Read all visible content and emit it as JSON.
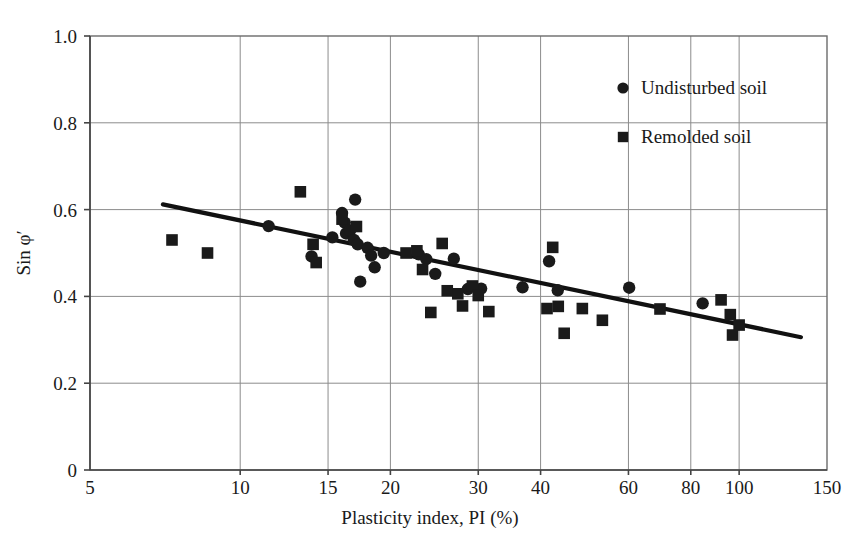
{
  "chart_data": {
    "type": "scatter",
    "title": "",
    "xlabel": "Plasticity index, PI (%)",
    "ylabel": "Sin φ′",
    "xscale": "log",
    "yscale": "linear",
    "xlim": [
      5,
      150
    ],
    "ylim": [
      0,
      1.0
    ],
    "grid": true,
    "xticks": [
      5,
      10,
      15,
      20,
      30,
      40,
      60,
      80,
      100,
      150
    ],
    "xtick_labels": [
      "5",
      "10",
      "15",
      "20",
      "30",
      "40",
      "60",
      "80",
      "100",
      "150"
    ],
    "yticks": [
      0,
      0.2,
      0.4,
      0.6,
      0.8,
      1.0
    ],
    "ytick_labels": [
      "0",
      "0.2",
      "0.4",
      "0.6",
      "0.8",
      "1.0"
    ],
    "legend_position": "top-right",
    "series": [
      {
        "name": "Undisturbed soil",
        "marker": "circle",
        "color": "#1a1a1a",
        "points": [
          [
            11.4,
            0.562
          ],
          [
            13.9,
            0.492
          ],
          [
            15.3,
            0.536
          ],
          [
            16.0,
            0.592
          ],
          [
            16.2,
            0.57
          ],
          [
            16.3,
            0.545
          ],
          [
            16.6,
            0.552
          ],
          [
            16.9,
            0.53
          ],
          [
            17.0,
            0.623
          ],
          [
            17.2,
            0.52
          ],
          [
            17.4,
            0.434
          ],
          [
            18.0,
            0.512
          ],
          [
            18.3,
            0.494
          ],
          [
            18.6,
            0.467
          ],
          [
            19.4,
            0.5
          ],
          [
            22.8,
            0.497
          ],
          [
            23.6,
            0.486
          ],
          [
            24.6,
            0.452
          ],
          [
            26.8,
            0.487
          ],
          [
            28.6,
            0.417
          ],
          [
            30.4,
            0.418
          ],
          [
            36.8,
            0.421
          ],
          [
            41.6,
            0.481
          ],
          [
            43.3,
            0.414
          ],
          [
            60.2,
            0.42
          ],
          [
            84.5,
            0.384
          ]
        ]
      },
      {
        "name": "Remolded soil",
        "marker": "square",
        "color": "#1a1a1a",
        "points": [
          [
            7.3,
            0.53
          ],
          [
            8.6,
            0.5
          ],
          [
            13.2,
            0.641
          ],
          [
            14.0,
            0.52
          ],
          [
            14.2,
            0.478
          ],
          [
            16.0,
            0.578
          ],
          [
            17.1,
            0.561
          ],
          [
            21.5,
            0.5
          ],
          [
            22.6,
            0.505
          ],
          [
            23.2,
            0.462
          ],
          [
            24.1,
            0.363
          ],
          [
            25.4,
            0.522
          ],
          [
            26.0,
            0.413
          ],
          [
            27.3,
            0.406
          ],
          [
            27.9,
            0.378
          ],
          [
            29.2,
            0.424
          ],
          [
            30.0,
            0.402
          ],
          [
            31.5,
            0.365
          ],
          [
            41.2,
            0.372
          ],
          [
            42.3,
            0.513
          ],
          [
            43.4,
            0.377
          ],
          [
            44.6,
            0.315
          ],
          [
            48.5,
            0.372
          ],
          [
            53.2,
            0.345
          ],
          [
            69.4,
            0.371
          ],
          [
            92.0,
            0.392
          ],
          [
            96.0,
            0.358
          ],
          [
            97.0,
            0.311
          ],
          [
            100.0,
            0.334
          ]
        ]
      }
    ],
    "trend_line": {
      "name": "best-fit-trend",
      "points": [
        [
          7.0,
          0.612
        ],
        [
          133.0,
          0.306
        ]
      ]
    }
  },
  "legend": {
    "items": [
      {
        "label": "Undisturbed soil",
        "marker": "circle"
      },
      {
        "label": "Remolded soil",
        "marker": "square"
      }
    ]
  },
  "colors": {
    "marker": "#1a1a1a",
    "grid": "#8c8c8c",
    "frame": "#6b6b6b",
    "trend": "#111111",
    "background": "#ffffff"
  }
}
